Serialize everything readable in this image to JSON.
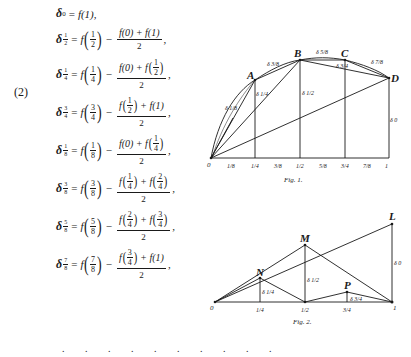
{
  "equation_number": "(2)",
  "equations": [
    {
      "sub_num": "0",
      "arg": "1",
      "type": "simple",
      "trailing": ","
    },
    {
      "sub_num": "1",
      "sub_den": "2",
      "arg_n": "1",
      "arg_d": "2",
      "left": "f(0)",
      "right": "f(1)",
      "denominator": "2",
      "trailing": ","
    },
    {
      "sub_num": "1",
      "sub_den": "4",
      "arg_n": "1",
      "arg_d": "4",
      "left": "f(0)",
      "right_n": "1",
      "right_d": "2",
      "denominator": "2",
      "trailing": ","
    },
    {
      "sub_num": "3",
      "sub_den": "4",
      "arg_n": "3",
      "arg_d": "4",
      "left_n": "1",
      "left_d": "2",
      "right": "f(1)",
      "denominator": "2",
      "trailing": ","
    },
    {
      "sub_num": "1",
      "sub_den": "8",
      "arg_n": "1",
      "arg_d": "8",
      "left": "f(0)",
      "right_n": "1",
      "right_d": "4",
      "denominator": "2",
      "trailing": ","
    },
    {
      "sub_num": "3",
      "sub_den": "8",
      "arg_n": "3",
      "arg_d": "8",
      "left_n": "1",
      "left_d": "4",
      "right_n": "2",
      "right_d": "4",
      "denominator": "2",
      "trailing": ","
    },
    {
      "sub_num": "5",
      "sub_den": "8",
      "arg_n": "5",
      "arg_d": "8",
      "left_n": "2",
      "left_d": "4",
      "right_n": "3",
      "right_d": "4",
      "denominator": "2",
      "trailing": ","
    },
    {
      "sub_num": "7",
      "sub_den": "8",
      "arg_n": "7",
      "arg_d": "8",
      "left_n": "3",
      "left_d": "4",
      "right": "f(1)",
      "denominator": "2",
      "trailing": ","
    }
  ],
  "continuation_dots": ". . . . . . . . . .",
  "symbols": {
    "delta": "δ",
    "f": "f",
    "minus": "−",
    "plus": "+",
    "equals": "="
  },
  "fig1": {
    "caption": "Fig. 1.",
    "points": {
      "O": "O",
      "A": "A",
      "B": "B",
      "C": "C",
      "D": "D"
    },
    "delta_labels": [
      "δ 1/8",
      "δ 1/4",
      "δ 3/8",
      "δ 1/2",
      "δ 5/8",
      "δ 3/4",
      "δ 7/8",
      "δ 0"
    ],
    "axis_ticks": [
      "1/8",
      "1/4",
      "3/8",
      "1/2",
      "5/8",
      "3/4",
      "7/8",
      "1"
    ],
    "origin_label": "0",
    "end_label": "1"
  },
  "fig2": {
    "caption": "Fig. 2.",
    "points": {
      "L": "L",
      "M": "M",
      "N": "N",
      "P": "P"
    },
    "delta_labels": [
      "δ 1/4",
      "δ 1/2",
      "δ 3/4",
      "δ 0"
    ],
    "axis_ticks": [
      "1/4",
      "1/2",
      "3/4"
    ],
    "origin_label": "0",
    "end_label": "1"
  }
}
